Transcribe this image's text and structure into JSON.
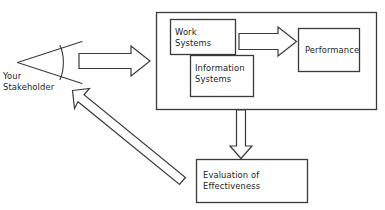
{
  "diagram": {
    "type": "flow-diagram",
    "background_color": "#ffffff",
    "stroke_color": "#3a3a3a",
    "text_color": "#1c1c1c",
    "actor": {
      "name": "stakeholder-viewpoint",
      "label": "Your\nStakeholder",
      "icon": "eye-viewpoint-icon"
    },
    "container": {
      "name": "organization-container",
      "label": ""
    },
    "nodes": [
      {
        "id": "work-systems",
        "label": "Work\nSystems"
      },
      {
        "id": "information-systems",
        "label": "Information\nSystems"
      },
      {
        "id": "performance",
        "label": "Performance"
      },
      {
        "id": "evaluation",
        "label": "Evaluation of\nEffectiveness"
      }
    ],
    "arrows": [
      {
        "id": "stakeholder-to-container",
        "direction": "right",
        "from": "stakeholder",
        "to": "organization-container"
      },
      {
        "id": "work-to-performance",
        "direction": "right",
        "from": "work-systems",
        "to": "performance"
      },
      {
        "id": "container-to-evaluation",
        "direction": "down",
        "from": "organization-container",
        "to": "evaluation"
      },
      {
        "id": "evaluation-to-stakeholder",
        "direction": "diagonal-up-left",
        "from": "evaluation",
        "to": "stakeholder"
      }
    ]
  }
}
